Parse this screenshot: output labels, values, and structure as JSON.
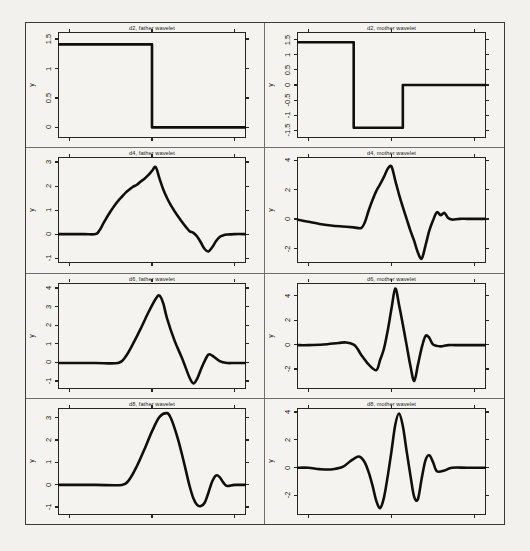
{
  "figure": {
    "background_color": "#f2f1ee",
    "frame_color": "#3a3a38",
    "line_color": "#100f0b",
    "axis_label": "y"
  },
  "chart_data": [
    {
      "type": "line",
      "title": "d2, father wavelet",
      "position": "row1-left",
      "xlabel": "",
      "ylabel": "y",
      "ylim": [
        -0.18,
        1.62
      ],
      "yticks": [
        0,
        0.5,
        1,
        1.5
      ],
      "yticklabels": [
        "0",
        "0.5",
        "1",
        "1.5"
      ],
      "xlim": [
        0,
        1
      ],
      "xticks": [
        0.06,
        0.5,
        0.94
      ],
      "grid": false,
      "legend": "none",
      "x": [
        0.0,
        0.06,
        0.06,
        0.5,
        0.5,
        1.0
      ],
      "y": [
        1.41,
        1.41,
        1.41,
        1.41,
        0.0,
        0.0
      ]
    },
    {
      "type": "line",
      "title": "d2, mother wavelet",
      "position": "row1-right",
      "xlabel": "",
      "ylabel": "y",
      "ylim": [
        -1.75,
        1.75
      ],
      "yticks": [
        -1.5,
        -1,
        -0.5,
        0,
        0.5,
        1,
        1.5
      ],
      "yticklabels": [
        "-1.5",
        "-1",
        "-0.5",
        "0",
        "0.5",
        "1",
        "1.5"
      ],
      "xlim": [
        0,
        1
      ],
      "xticks": [
        0.06,
        0.5,
        0.94
      ],
      "grid": false,
      "legend": "none",
      "x": [
        0.0,
        0.06,
        0.3,
        0.3,
        0.56,
        0.56,
        1.0
      ],
      "y": [
        1.41,
        1.41,
        1.41,
        -1.41,
        -1.41,
        0.0,
        0.0
      ]
    },
    {
      "type": "line",
      "title": "d4, father wavelet",
      "position": "row2-left",
      "xlabel": "",
      "ylabel": "y",
      "ylim": [
        -1.2,
        3.2
      ],
      "yticks": [
        -1,
        0,
        1,
        2,
        3
      ],
      "yticklabels": [
        "-1",
        "0",
        "1",
        "2",
        "3"
      ],
      "xlim": [
        0,
        1
      ],
      "xticks": [
        0.06,
        0.5,
        0.94
      ],
      "grid": false,
      "legend": "none",
      "x": [
        0.0,
        0.06,
        0.14,
        0.2,
        0.22,
        0.24,
        0.26,
        0.28,
        0.3,
        0.32,
        0.34,
        0.36,
        0.38,
        0.4,
        0.42,
        0.44,
        0.46,
        0.48,
        0.5,
        0.52,
        0.54,
        0.56,
        0.58,
        0.6,
        0.62,
        0.64,
        0.66,
        0.68,
        0.7,
        0.72,
        0.74,
        0.76,
        0.78,
        0.8,
        0.82,
        0.84,
        0.86,
        0.88,
        0.9,
        0.94,
        1.0
      ],
      "y": [
        0.0,
        0.0,
        0.0,
        0.0,
        0.15,
        0.42,
        0.7,
        0.95,
        1.18,
        1.38,
        1.55,
        1.72,
        1.85,
        1.97,
        2.05,
        2.18,
        2.3,
        2.45,
        2.62,
        2.78,
        2.3,
        1.85,
        1.5,
        1.2,
        0.95,
        0.72,
        0.5,
        0.3,
        0.12,
        0.05,
        -0.1,
        -0.35,
        -0.62,
        -0.72,
        -0.55,
        -0.3,
        -0.12,
        -0.05,
        -0.02,
        0.0,
        0.0
      ]
    },
    {
      "type": "line",
      "title": "d4, mother wavelet",
      "position": "row2-right",
      "xlabel": "",
      "ylabel": "y",
      "ylim": [
        -3.0,
        4.2
      ],
      "yticks": [
        -2,
        0,
        2,
        4
      ],
      "yticklabels": [
        "-2",
        "0",
        "2",
        "4"
      ],
      "xlim": [
        0,
        1
      ],
      "xticks": [
        0.06,
        0.5,
        0.94
      ],
      "grid": false,
      "legend": "none",
      "x": [
        0.0,
        0.06,
        0.12,
        0.18,
        0.24,
        0.3,
        0.34,
        0.36,
        0.38,
        0.4,
        0.42,
        0.44,
        0.46,
        0.48,
        0.5,
        0.52,
        0.54,
        0.56,
        0.58,
        0.6,
        0.62,
        0.64,
        0.66,
        0.68,
        0.7,
        0.72,
        0.74,
        0.76,
        0.78,
        0.8,
        0.82,
        0.86,
        0.9,
        0.94,
        1.0
      ],
      "y": [
        -0.05,
        -0.2,
        -0.35,
        -0.45,
        -0.52,
        -0.58,
        -0.62,
        -0.2,
        0.6,
        1.3,
        1.9,
        2.35,
        2.85,
        3.4,
        3.55,
        2.6,
        1.65,
        0.8,
        0.0,
        -0.8,
        -1.5,
        -2.3,
        -2.7,
        -1.8,
        -0.8,
        -0.1,
        0.45,
        0.25,
        0.4,
        0.05,
        -0.05,
        0.0,
        0.0,
        0.0,
        0.0
      ]
    },
    {
      "type": "line",
      "title": "d6, father wavelet",
      "position": "row3-left",
      "xlabel": "",
      "ylabel": "y",
      "ylim": [
        -1.4,
        4.3
      ],
      "yticks": [
        -1,
        0,
        1,
        2,
        3,
        4
      ],
      "yticklabels": [
        "-1",
        "0",
        "1",
        "2",
        "3",
        "4"
      ],
      "xlim": [
        0,
        1
      ],
      "xticks": [
        0.06,
        0.5,
        0.94
      ],
      "grid": false,
      "legend": "none",
      "x": [
        0.0,
        0.06,
        0.2,
        0.32,
        0.36,
        0.4,
        0.44,
        0.48,
        0.52,
        0.54,
        0.56,
        0.58,
        0.62,
        0.66,
        0.7,
        0.72,
        0.74,
        0.76,
        0.78,
        0.8,
        0.82,
        0.86,
        0.9,
        0.94,
        1.0
      ],
      "y": [
        0.0,
        0.0,
        0.0,
        0.0,
        0.35,
        1.05,
        1.85,
        2.7,
        3.45,
        3.62,
        3.2,
        2.4,
        1.2,
        0.25,
        -0.8,
        -1.1,
        -0.85,
        -0.35,
        0.1,
        0.45,
        0.4,
        0.1,
        0.0,
        0.0,
        0.0
      ]
    },
    {
      "type": "line",
      "title": "d6, mother wavelet",
      "position": "row3-right",
      "xlabel": "",
      "ylabel": "y",
      "ylim": [
        -3.6,
        5.1
      ],
      "yticks": [
        -2,
        0,
        2,
        4
      ],
      "yticklabels": [
        "-2",
        "0",
        "2",
        "4"
      ],
      "xlim": [
        0,
        1
      ],
      "xticks": [
        0.06,
        0.5,
        0.94
      ],
      "grid": false,
      "legend": "none",
      "x": [
        0.0,
        0.06,
        0.14,
        0.22,
        0.26,
        0.3,
        0.32,
        0.34,
        0.38,
        0.42,
        0.44,
        0.46,
        0.48,
        0.5,
        0.52,
        0.54,
        0.56,
        0.58,
        0.6,
        0.62,
        0.64,
        0.66,
        0.68,
        0.7,
        0.72,
        0.76,
        0.8,
        0.86,
        0.94,
        1.0
      ],
      "y": [
        0.0,
        0.0,
        0.05,
        0.18,
        0.22,
        0.05,
        -0.3,
        -0.8,
        -1.6,
        -2.05,
        -1.2,
        -0.3,
        1.2,
        3.0,
        4.65,
        3.3,
        1.7,
        0.0,
        -1.7,
        -2.95,
        -1.6,
        -0.2,
        0.75,
        0.6,
        0.05,
        -0.1,
        0.0,
        0.0,
        0.0,
        0.0
      ]
    },
    {
      "type": "line",
      "title": "d8, father wavelet",
      "position": "row4-left",
      "xlabel": "",
      "ylabel": "y",
      "ylim": [
        -1.35,
        3.45
      ],
      "yticks": [
        -1,
        0,
        1,
        2,
        3
      ],
      "yticklabels": [
        "-1",
        "0",
        "1",
        "2",
        "3"
      ],
      "xlim": [
        0,
        1
      ],
      "xticks": [
        0.06,
        0.5,
        0.94
      ],
      "grid": false,
      "legend": "none",
      "x": [
        0.0,
        0.06,
        0.2,
        0.34,
        0.38,
        0.42,
        0.46,
        0.5,
        0.54,
        0.58,
        0.6,
        0.62,
        0.64,
        0.66,
        0.68,
        0.7,
        0.72,
        0.74,
        0.76,
        0.78,
        0.8,
        0.82,
        0.84,
        0.86,
        0.88,
        0.9,
        0.94,
        1.0
      ],
      "y": [
        0.0,
        0.0,
        0.0,
        0.0,
        0.25,
        0.85,
        1.6,
        2.4,
        3.05,
        3.22,
        3.0,
        2.55,
        2.0,
        1.35,
        0.65,
        -0.05,
        -0.6,
        -0.9,
        -0.95,
        -0.8,
        -0.35,
        0.15,
        0.42,
        0.35,
        0.1,
        -0.05,
        0.0,
        0.0
      ]
    },
    {
      "type": "line",
      "title": "d8, mother wavelet",
      "position": "row4-right",
      "xlabel": "",
      "ylabel": "y",
      "ylim": [
        -3.4,
        4.3
      ],
      "yticks": [
        -2,
        0,
        2,
        4
      ],
      "yticklabels": [
        "-2",
        "0",
        "2",
        "4"
      ],
      "xlim": [
        0,
        1
      ],
      "xticks": [
        0.06,
        0.5,
        0.94
      ],
      "grid": false,
      "legend": "none",
      "x": [
        0.0,
        0.06,
        0.12,
        0.18,
        0.24,
        0.28,
        0.32,
        0.34,
        0.36,
        0.38,
        0.4,
        0.42,
        0.44,
        0.46,
        0.48,
        0.5,
        0.52,
        0.54,
        0.56,
        0.58,
        0.6,
        0.62,
        0.64,
        0.66,
        0.68,
        0.7,
        0.72,
        0.74,
        0.78,
        0.82,
        0.9,
        1.0
      ],
      "y": [
        0.0,
        0.0,
        -0.1,
        -0.12,
        0.05,
        0.45,
        0.8,
        0.72,
        0.35,
        -0.35,
        -1.3,
        -2.4,
        -2.9,
        -2.15,
        -0.6,
        1.2,
        3.1,
        3.9,
        3.0,
        1.2,
        -0.55,
        -2.1,
        -2.25,
        -0.75,
        0.55,
        0.9,
        0.4,
        -0.25,
        -0.2,
        0.0,
        0.0,
        0.0
      ]
    }
  ]
}
